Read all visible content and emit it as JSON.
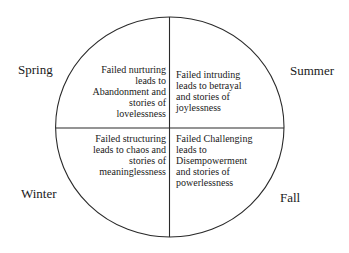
{
  "diagram": {
    "type": "quadrant-circle",
    "line_color": "#2a2a2a",
    "background": "#ffffff",
    "seasons": {
      "spring": "Spring",
      "summer": "Summer",
      "winter": "Winter",
      "fall": "Fall"
    },
    "quadrants": {
      "top_left": {
        "season": "Spring",
        "lines": [
          "Failed nurturing",
          "leads to",
          "Abandonment and",
          "stories of",
          "lovelessness"
        ]
      },
      "top_right": {
        "season": "Summer",
        "lines": [
          "Failed intruding",
          "leads to betrayal",
          "and stories of",
          "joylessness"
        ]
      },
      "bottom_left": {
        "season": "Winter",
        "lines": [
          "Failed structuring",
          "leads to chaos and",
          "stories of",
          "meaninglessness"
        ]
      },
      "bottom_right": {
        "season": "Fall",
        "lines": [
          "Failed Challenging",
          "leads to",
          "Disempowerment",
          "and stories of",
          "powerlessness"
        ]
      }
    }
  }
}
